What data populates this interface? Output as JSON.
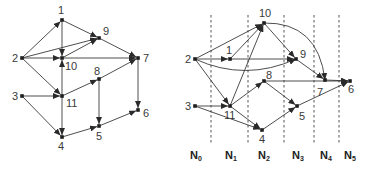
{
  "left_graph": {
    "nodes": [
      {
        "id": "1",
        "x": 62,
        "y": 20,
        "lx": 58,
        "ly": 14
      },
      {
        "id": "2",
        "x": 22,
        "y": 58,
        "lx": 12,
        "ly": 62
      },
      {
        "id": "9",
        "x": 99,
        "y": 38,
        "lx": 103,
        "ly": 35
      },
      {
        "id": "10",
        "x": 62,
        "y": 58,
        "lx": 65,
        "ly": 70
      },
      {
        "id": "7",
        "x": 138,
        "y": 58,
        "lx": 143,
        "ly": 62
      },
      {
        "id": "8",
        "x": 99,
        "y": 79,
        "lx": 94,
        "ly": 75
      },
      {
        "id": "3",
        "x": 22,
        "y": 96,
        "lx": 12,
        "ly": 100
      },
      {
        "id": "11",
        "x": 62,
        "y": 96,
        "lx": 66,
        "ly": 107
      },
      {
        "id": "6",
        "x": 138,
        "y": 110,
        "lx": 143,
        "ly": 117
      },
      {
        "id": "5",
        "x": 99,
        "y": 126,
        "lx": 96,
        "ly": 140
      },
      {
        "id": "4",
        "x": 62,
        "y": 137,
        "lx": 58,
        "ly": 150
      }
    ],
    "edges": [
      [
        "2",
        "1"
      ],
      [
        "2",
        "10"
      ],
      [
        "2",
        "9"
      ],
      [
        "2",
        "11"
      ],
      [
        "1",
        "10"
      ],
      [
        "1",
        "9"
      ],
      [
        "10",
        "9"
      ],
      [
        "10",
        "7"
      ],
      [
        "9",
        "7"
      ],
      [
        "11",
        "10"
      ],
      [
        "11",
        "8"
      ],
      [
        "11",
        "4"
      ],
      [
        "3",
        "11"
      ],
      [
        "3",
        "4"
      ],
      [
        "8",
        "7"
      ],
      [
        "8",
        "5"
      ],
      [
        "7",
        "6"
      ],
      [
        "4",
        "5"
      ],
      [
        "5",
        "6"
      ]
    ]
  },
  "right_graph": {
    "nodes": [
      {
        "id": "10",
        "x": 264,
        "y": 23,
        "lx": 259,
        "ly": 17
      },
      {
        "id": "2",
        "x": 195,
        "y": 59,
        "lx": 185,
        "ly": 63
      },
      {
        "id": "1",
        "x": 230,
        "y": 59,
        "lx": 226,
        "ly": 54
      },
      {
        "id": "9",
        "x": 296,
        "y": 59,
        "lx": 300,
        "ly": 58
      },
      {
        "id": "8",
        "x": 264,
        "y": 81,
        "lx": 266,
        "ly": 79
      },
      {
        "id": "7",
        "x": 325,
        "y": 80,
        "lx": 317,
        "ly": 96
      },
      {
        "id": "6",
        "x": 350,
        "y": 81,
        "lx": 348,
        "ly": 93
      },
      {
        "id": "3",
        "x": 195,
        "y": 106,
        "lx": 185,
        "ly": 110
      },
      {
        "id": "11",
        "x": 230,
        "y": 106,
        "lx": 224,
        "ly": 119
      },
      {
        "id": "5",
        "x": 297,
        "y": 106,
        "lx": 299,
        "ly": 120
      },
      {
        "id": "4",
        "x": 262,
        "y": 130,
        "lx": 259,
        "ly": 143
      }
    ],
    "edges": [
      {
        "from": "2",
        "to": "1"
      },
      {
        "from": "2",
        "to": "10"
      },
      {
        "from": "2",
        "to": "11"
      },
      {
        "from": "2",
        "to": "9",
        "curve": "M195,59 Q245,82 296,59"
      },
      {
        "from": "1",
        "to": "10"
      },
      {
        "from": "1",
        "to": "9"
      },
      {
        "from": "11",
        "to": "10"
      },
      {
        "from": "11",
        "to": "8"
      },
      {
        "from": "11",
        "to": "4"
      },
      {
        "from": "3",
        "to": "11"
      },
      {
        "from": "3",
        "to": "4"
      },
      {
        "from": "10",
        "to": "9"
      },
      {
        "from": "10",
        "to": "7",
        "curve": "M264,23 Q318,22 325,80"
      },
      {
        "from": "9",
        "to": "7"
      },
      {
        "from": "8",
        "to": "6"
      },
      {
        "from": "8",
        "to": "5"
      },
      {
        "from": "4",
        "to": "5"
      },
      {
        "from": "5",
        "to": "6"
      },
      {
        "from": "7",
        "to": "6"
      }
    ],
    "dividers": [
      211,
      248,
      284,
      314,
      339
    ],
    "divider_y_range": [
      15,
      143
    ],
    "levels": [
      {
        "main": "N",
        "sub": "0",
        "x": 195
      },
      {
        "main": "N",
        "sub": "1",
        "x": 230
      },
      {
        "main": "N",
        "sub": "2",
        "x": 263
      },
      {
        "main": "N",
        "sub": "3",
        "x": 297
      },
      {
        "main": "N",
        "sub": "4",
        "x": 325
      },
      {
        "main": "N",
        "sub": "5",
        "x": 349
      }
    ],
    "levels_y": 159
  }
}
